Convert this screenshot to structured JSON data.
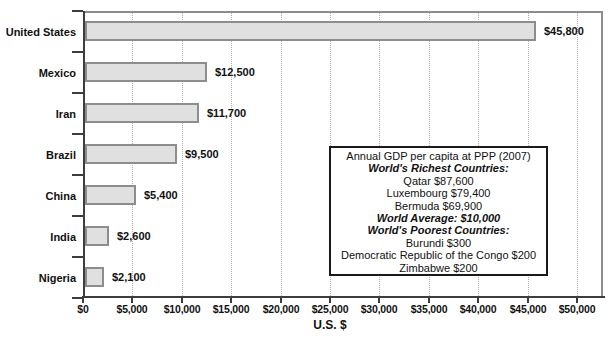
{
  "colors": {
    "background": "#ffffff",
    "bar_fill": "#e0e0e0",
    "bar_border": "#8d8d8d",
    "frame_border": "#8d8d8d",
    "axis": "#3d3d3d",
    "gridline": "#ababab",
    "text": "#111111"
  },
  "chart_data": {
    "type": "bar",
    "orientation": "horizontal",
    "cropped_title": "Annual GDP per capita at PPP (2007)",
    "categories": [
      "United States",
      "Mexico",
      "Iran",
      "Brazil",
      "China",
      "India",
      "Nigeria"
    ],
    "values": [
      45800,
      12500,
      11700,
      9500,
      5400,
      2600,
      2100
    ],
    "value_labels": [
      "$45,800",
      "$12,500",
      "$11,700",
      "$9,500",
      "$5,400",
      "$2,600",
      "$2,100"
    ],
    "xlabel": "U.S. $",
    "xlim": [
      0,
      50000
    ],
    "xtick_interval": 5000,
    "xtick_values": [
      0,
      5000,
      10000,
      15000,
      20000,
      25000,
      30000,
      35000,
      40000,
      45000,
      50000
    ],
    "xtick_labels": [
      "$0",
      "$5,000",
      "$10,000",
      "$15,000",
      "$20,000",
      "$25,000",
      "$30,000",
      "$35,000",
      "$40,000",
      "$45,000",
      "$50,000"
    ],
    "grid": "vertical-dotted",
    "annotation_box": {
      "lines": [
        {
          "text": "Annual GDP per capita at PPP (2007)",
          "style": "regular"
        },
        {
          "text": "World's Richest Countries:",
          "style": "bold-italic"
        },
        {
          "text": "Qatar $87,600",
          "style": "regular"
        },
        {
          "text": "Luxembourg $79,400",
          "style": "regular"
        },
        {
          "text": "Bermuda $69,900",
          "style": "regular"
        },
        {
          "text": "World Average: $10,000",
          "style": "bold-italic"
        },
        {
          "text": "World's Poorest Countries:",
          "style": "bold-italic"
        },
        {
          "text": "Burundi $300",
          "style": "regular"
        },
        {
          "text": "Democratic Republic of the Congo $200",
          "style": "regular"
        },
        {
          "text": "Zimbabwe $200",
          "style": "regular"
        }
      ]
    }
  }
}
